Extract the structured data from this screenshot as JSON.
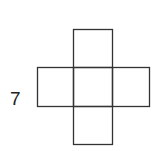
{
  "figure": {
    "label": "7",
    "stroke_color": "#333333",
    "squares": [
      {
        "name": "top",
        "x": 73,
        "y": 29,
        "w": 39,
        "h": 38
      },
      {
        "name": "left",
        "x": 37,
        "y": 67,
        "w": 36,
        "h": 39
      },
      {
        "name": "center",
        "x": 73,
        "y": 67,
        "w": 39,
        "h": 39
      },
      {
        "name": "right",
        "x": 112,
        "y": 67,
        "w": 37,
        "h": 39
      },
      {
        "name": "bottom",
        "x": 73,
        "y": 106,
        "w": 39,
        "h": 38
      }
    ]
  }
}
